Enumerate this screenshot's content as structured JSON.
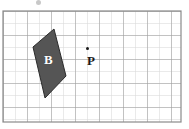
{
  "figure": {
    "background_color": "#ffffff",
    "grid": {
      "minor_line_color": "#d6d6d6",
      "major_line_color": "#9a9a9a",
      "border_color": "#8a8a8a",
      "cell_size_px": 12,
      "columns": 15,
      "rows": 9,
      "origin_x_px": 3,
      "origin_y_px": 11,
      "width_px": 178,
      "height_px": 111,
      "major_every": 2
    },
    "shapes": [
      {
        "name": "quadrilateral-b",
        "label": "B",
        "label_color": "#ffffff",
        "fill_color": "#555555",
        "stroke_color": "#2b2b2b",
        "points_px": "54,29 66,76 45,98 33,47",
        "label_position_px": {
          "x": 44,
          "y": 53
        }
      }
    ],
    "points": [
      {
        "name": "point-p",
        "label": "P",
        "label_color": "#1a1a1a",
        "dot_color": "#1a1a1a",
        "dot_position_px": {
          "x": 87,
          "y": 48
        },
        "label_position_px": {
          "x": 87,
          "y": 54
        }
      }
    ],
    "artifacts": [
      {
        "name": "cropped-mark",
        "position_px": {
          "x": 36,
          "y": 0
        },
        "color": "#9a9a9a"
      }
    ]
  }
}
